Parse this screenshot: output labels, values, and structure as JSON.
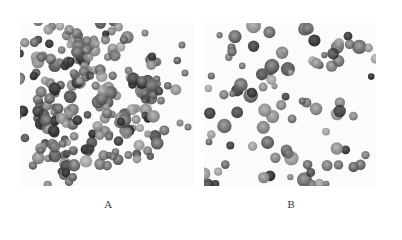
{
  "figure": {
    "panels": [
      {
        "id": "A",
        "label": "A",
        "description": "Dense clusters of grayscale stained cells (micrograph)"
      },
      {
        "id": "B",
        "label": "B",
        "description": "Sparser scattered grayscale stained cells with several darkly stained cells (micrograph)"
      }
    ]
  }
}
